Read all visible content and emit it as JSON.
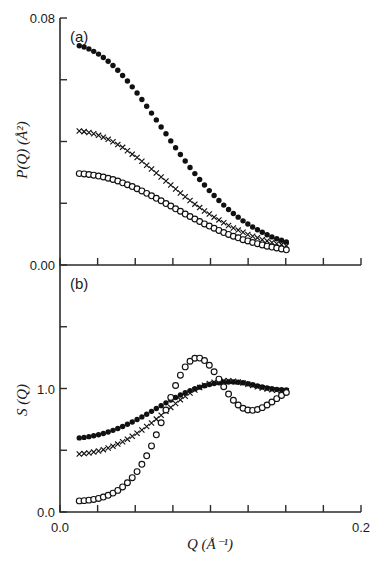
{
  "figure": {
    "width": 385,
    "height": 561,
    "background": "#ffffff",
    "ink_color": "#111111"
  },
  "panel_labels": {
    "a": "(a)",
    "b": "(b)"
  },
  "axis_titles": {
    "x": "Q  (Å⁻¹)",
    "y_top": "P(Q)  (Å²)",
    "y_bottom": "S (Q)"
  },
  "tick_labels": {
    "x": [
      "0.0",
      "0.2"
    ],
    "y_top": [
      "0.00",
      "0.08"
    ],
    "y_bottom": [
      "0.0",
      "1.0"
    ]
  },
  "chart_data": [
    {
      "type": "scatter",
      "id": "panel-a",
      "title": "(a)",
      "xlabel": "Q  (Å⁻¹)",
      "ylabel": "P(Q)  (Å²)",
      "xlim": [
        0.0,
        0.2
      ],
      "ylim": [
        0.0,
        0.08
      ],
      "xticks": [
        0.0,
        0.025,
        0.05,
        0.075,
        0.1,
        0.125,
        0.15,
        0.175,
        0.2
      ],
      "xticklabels": [
        "0.0",
        "",
        "",
        "",
        "",
        "",
        "",
        "",
        "0.2"
      ],
      "yticks": [
        0.0,
        0.02,
        0.04,
        0.06,
        0.08
      ],
      "yticklabels": [
        "0.00",
        "",
        "",
        "",
        "0.08"
      ],
      "grid": false,
      "legend": "none",
      "series": [
        {
          "name": "filled-circles",
          "marker": "filled-circle",
          "x": [
            0.0128,
            0.016,
            0.0192,
            0.0224,
            0.0256,
            0.0288,
            0.032,
            0.0352,
            0.0384,
            0.0416,
            0.0448,
            0.048,
            0.0512,
            0.0544,
            0.0576,
            0.0608,
            0.064,
            0.0672,
            0.0704,
            0.0736,
            0.0768,
            0.08,
            0.0832,
            0.0864,
            0.0896,
            0.0928,
            0.096,
            0.0992,
            0.1024,
            0.1056,
            0.1088,
            0.112,
            0.1152,
            0.1184,
            0.1216,
            0.1248,
            0.128,
            0.1312,
            0.1344,
            0.1376,
            0.1408,
            0.144,
            0.1472,
            0.1504
          ],
          "y": [
            0.071,
            0.0706,
            0.07,
            0.0692,
            0.0683,
            0.0672,
            0.066,
            0.0646,
            0.0631,
            0.0614,
            0.0596,
            0.0577,
            0.0557,
            0.0536,
            0.0514,
            0.0492,
            0.047,
            0.0447,
            0.0425,
            0.0402,
            0.038,
            0.0358,
            0.0337,
            0.0316,
            0.0296,
            0.0277,
            0.0259,
            0.0241,
            0.0225,
            0.0209,
            0.0194,
            0.018,
            0.0167,
            0.0155,
            0.0143,
            0.0133,
            0.0123,
            0.0114,
            0.0106,
            0.0098,
            0.0091,
            0.0085,
            0.008,
            0.0075
          ]
        },
        {
          "name": "crosses",
          "marker": "cross",
          "x": [
            0.0128,
            0.016,
            0.0192,
            0.0224,
            0.0256,
            0.0288,
            0.032,
            0.0352,
            0.0384,
            0.0416,
            0.0448,
            0.048,
            0.0512,
            0.0544,
            0.0576,
            0.0608,
            0.064,
            0.0672,
            0.0704,
            0.0736,
            0.0768,
            0.08,
            0.0832,
            0.0864,
            0.0896,
            0.0928,
            0.096,
            0.0992,
            0.1024,
            0.1056,
            0.1088,
            0.112,
            0.1152,
            0.1184,
            0.1216,
            0.1248,
            0.128,
            0.1312,
            0.1344,
            0.1376,
            0.1408,
            0.144,
            0.1472,
            0.1504
          ],
          "y": [
            0.0434,
            0.0432,
            0.0429,
            0.0425,
            0.042,
            0.0414,
            0.0407,
            0.0399,
            0.039,
            0.0381,
            0.037,
            0.0359,
            0.0348,
            0.0336,
            0.0323,
            0.0311,
            0.0298,
            0.0285,
            0.0272,
            0.0259,
            0.0246,
            0.0233,
            0.0221,
            0.0209,
            0.0197,
            0.0186,
            0.0175,
            0.0165,
            0.0155,
            0.0146,
            0.0137,
            0.0128,
            0.012,
            0.0113,
            0.0106,
            0.0099,
            0.0093,
            0.0088,
            0.0082,
            0.0078,
            0.0073,
            0.0069,
            0.0066,
            0.0062
          ]
        },
        {
          "name": "open-circles",
          "marker": "open-circle",
          "x": [
            0.0128,
            0.016,
            0.0192,
            0.0224,
            0.0256,
            0.0288,
            0.032,
            0.0352,
            0.0384,
            0.0416,
            0.0448,
            0.048,
            0.0512,
            0.0544,
            0.0576,
            0.0608,
            0.064,
            0.0672,
            0.0704,
            0.0736,
            0.0768,
            0.08,
            0.0832,
            0.0864,
            0.0896,
            0.0928,
            0.096,
            0.0992,
            0.1024,
            0.1056,
            0.1088,
            0.112,
            0.1152,
            0.1184,
            0.1216,
            0.1248,
            0.128,
            0.1312,
            0.1344,
            0.1376,
            0.1408,
            0.144,
            0.1472,
            0.1504
          ],
          "y": [
            0.0296,
            0.0295,
            0.0293,
            0.0291,
            0.0288,
            0.0285,
            0.0281,
            0.0277,
            0.0272,
            0.0266,
            0.026,
            0.0254,
            0.0247,
            0.024,
            0.0232,
            0.0224,
            0.0216,
            0.0208,
            0.0199,
            0.0191,
            0.0182,
            0.0174,
            0.0165,
            0.0157,
            0.0149,
            0.0141,
            0.0133,
            0.0126,
            0.0119,
            0.0112,
            0.0105,
            0.0099,
            0.0093,
            0.0088,
            0.0082,
            0.0078,
            0.0073,
            0.0069,
            0.0065,
            0.0061,
            0.0058,
            0.0055,
            0.0052,
            0.0049
          ]
        }
      ]
    },
    {
      "type": "scatter",
      "id": "panel-b",
      "title": "(b)",
      "xlabel": "Q  (Å⁻¹)",
      "ylabel": "S (Q)",
      "xlim": [
        0.0,
        0.2
      ],
      "ylim": [
        0.0,
        2.0
      ],
      "xticks": [
        0.0,
        0.025,
        0.05,
        0.075,
        0.1,
        0.125,
        0.15,
        0.175,
        0.2
      ],
      "xticklabels": [
        "0.0",
        "",
        "",
        "",
        "",
        "",
        "",
        "",
        "0.2"
      ],
      "yticks": [
        0.0,
        0.5,
        1.0,
        1.5
      ],
      "yticklabels": [
        "0.0",
        "",
        "1.0",
        ""
      ],
      "grid": false,
      "legend": "none",
      "series": [
        {
          "name": "filled-circles",
          "marker": "filled-circle",
          "x": [
            0.0128,
            0.016,
            0.0192,
            0.0224,
            0.0256,
            0.0288,
            0.032,
            0.0352,
            0.0384,
            0.0416,
            0.0448,
            0.048,
            0.0512,
            0.0544,
            0.0576,
            0.0608,
            0.064,
            0.0672,
            0.0704,
            0.0736,
            0.0768,
            0.08,
            0.0832,
            0.0864,
            0.0896,
            0.0928,
            0.096,
            0.0992,
            0.1024,
            0.1056,
            0.1088,
            0.112,
            0.1152,
            0.1184,
            0.1216,
            0.1248,
            0.128,
            0.1312,
            0.1344,
            0.1376,
            0.1408,
            0.144,
            0.1472,
            0.1504
          ],
          "y": [
            0.6,
            0.604,
            0.61,
            0.617,
            0.626,
            0.636,
            0.648,
            0.661,
            0.676,
            0.692,
            0.71,
            0.729,
            0.749,
            0.77,
            0.792,
            0.815,
            0.838,
            0.861,
            0.884,
            0.906,
            0.927,
            0.947,
            0.966,
            0.983,
            0.998,
            1.011,
            1.022,
            1.032,
            1.04,
            1.046,
            1.051,
            1.053,
            1.053,
            1.051,
            1.046,
            1.039,
            1.03,
            1.021,
            1.012,
            1.004,
            0.998,
            0.993,
            0.99,
            0.989
          ]
        },
        {
          "name": "crosses",
          "marker": "cross",
          "x": [
            0.0128,
            0.016,
            0.0192,
            0.0224,
            0.0256,
            0.0288,
            0.032,
            0.0352,
            0.0384,
            0.0416,
            0.0448,
            0.048,
            0.0512,
            0.0544,
            0.0576,
            0.0608,
            0.064,
            0.0672,
            0.0704,
            0.0736,
            0.0768,
            0.08,
            0.0832,
            0.0864,
            0.0896,
            0.0928,
            0.096,
            0.0992,
            0.1024,
            0.1056,
            0.1088,
            0.112,
            0.1152,
            0.1184,
            0.1216,
            0.1248,
            0.128,
            0.1312,
            0.1344,
            0.1376,
            0.1408,
            0.144,
            0.1472,
            0.1504
          ],
          "y": [
            0.47,
            0.473,
            0.478,
            0.485,
            0.494,
            0.505,
            0.518,
            0.533,
            0.55,
            0.569,
            0.59,
            0.613,
            0.638,
            0.664,
            0.692,
            0.721,
            0.752,
            0.783,
            0.815,
            0.847,
            0.878,
            0.908,
            0.937,
            0.963,
            0.987,
            1.008,
            1.026,
            1.04,
            1.051,
            1.058,
            1.062,
            1.062,
            1.059,
            1.053,
            1.045,
            1.035,
            1.025,
            1.014,
            1.004,
            0.996,
            0.99,
            0.985,
            0.982,
            0.981
          ]
        },
        {
          "name": "open-circles",
          "marker": "open-circle",
          "x": [
            0.0128,
            0.016,
            0.0192,
            0.0224,
            0.0256,
            0.0288,
            0.032,
            0.0352,
            0.0384,
            0.0416,
            0.0448,
            0.048,
            0.0512,
            0.0544,
            0.0576,
            0.0608,
            0.064,
            0.0672,
            0.0704,
            0.0736,
            0.0768,
            0.08,
            0.0832,
            0.0864,
            0.0896,
            0.0928,
            0.096,
            0.0992,
            0.1024,
            0.1056,
            0.1088,
            0.112,
            0.1152,
            0.1184,
            0.1216,
            0.1248,
            0.128,
            0.1312,
            0.1344,
            0.1376,
            0.1408,
            0.144,
            0.1472,
            0.1504
          ],
          "y": [
            0.09,
            0.092,
            0.096,
            0.102,
            0.11,
            0.121,
            0.135,
            0.153,
            0.175,
            0.203,
            0.237,
            0.278,
            0.327,
            0.386,
            0.455,
            0.535,
            0.625,
            0.723,
            0.826,
            0.928,
            1.024,
            1.108,
            1.175,
            1.221,
            1.245,
            1.246,
            1.226,
            1.188,
            1.136,
            1.076,
            1.014,
            0.955,
            0.905,
            0.866,
            0.84,
            0.826,
            0.823,
            0.83,
            0.845,
            0.866,
            0.891,
            0.918,
            0.944,
            0.968
          ]
        }
      ]
    }
  ]
}
